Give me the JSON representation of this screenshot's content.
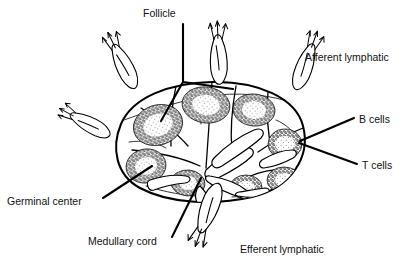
{
  "figure": {
    "background_color": "#ffffff",
    "ink_color": "#000000",
    "width": 409,
    "height": 261
  },
  "labels": [
    {
      "id": "follicle",
      "text": "Follicle",
      "x": 143,
      "y": 14,
      "anchor": "start",
      "leader": "M 183 24 L 183 82 M 183 82 L 160 120 M 183 82 L 233 89"
    },
    {
      "id": "afferent-lymphatic",
      "text": "Afferent lymphatic",
      "x": 305,
      "y": 58,
      "anchor": "start",
      "leader": ""
    },
    {
      "id": "b-cells",
      "text": "B cells",
      "x": 359,
      "y": 120,
      "anchor": "start",
      "leader": "M 354 118 L 300 141"
    },
    {
      "id": "t-cells",
      "text": "T cells",
      "x": 362,
      "y": 166,
      "anchor": "start",
      "leader": "M 357 164 L 299 143"
    },
    {
      "id": "germinal-center",
      "text": "Germinal center",
      "x": 7,
      "y": 202,
      "anchor": "start",
      "leader": "M 103 198 L 152 166"
    },
    {
      "id": "medullary-cord",
      "text": "Medullary cord",
      "x": 88,
      "y": 242,
      "anchor": "start",
      "leader": "M 172 237 L 201 178"
    },
    {
      "id": "efferent-lymphatic",
      "text": "Efferent lymphatic",
      "x": 240,
      "y": 250,
      "anchor": "start",
      "leader": ""
    }
  ],
  "node": {
    "capsule_path": "M 212 82 C 258 81 296 98 303 126 C 311 157 291 188 252 197 C 212 206 168 203 140 188 C 116 175 111 148 121 124 C 132 98 168 83 212 82 Z",
    "follicles": [
      {
        "id": "follicle-upper-left",
        "cx": 158,
        "cy": 125,
        "rx": 25,
        "ry": 20,
        "rot": -18,
        "gc_rx": 15,
        "gc_ry": 11
      },
      {
        "id": "follicle-upper-mid",
        "cx": 206,
        "cy": 105,
        "rx": 24,
        "ry": 18,
        "rot": 8,
        "gc_rx": 14,
        "gc_ry": 10
      },
      {
        "id": "follicle-upper-right",
        "cx": 254,
        "cy": 110,
        "rx": 21,
        "ry": 16,
        "rot": 6,
        "gc_rx": 12,
        "gc_ry": 9
      },
      {
        "id": "follicle-left-lower",
        "cx": 146,
        "cy": 166,
        "rx": 20,
        "ry": 17,
        "rot": -10,
        "gc_rx": 11,
        "gc_ry": 9
      },
      {
        "id": "follicle-mid-lower",
        "cx": 188,
        "cy": 183,
        "rx": 17,
        "ry": 13,
        "rot": 5,
        "gc_rx": 9,
        "gc_ry": 7
      },
      {
        "id": "follicle-right-mid",
        "cx": 285,
        "cy": 144,
        "rx": 17,
        "ry": 15,
        "rot": 0,
        "gc_rx": 10,
        "gc_ry": 8
      },
      {
        "id": "follicle-right-lower",
        "cx": 284,
        "cy": 180,
        "rx": 17,
        "ry": 13,
        "rot": 0,
        "gc_rx": 9,
        "gc_ry": 7
      },
      {
        "id": "follicle-bottom-mid",
        "cx": 246,
        "cy": 187,
        "rx": 16,
        "ry": 12,
        "rot": 0,
        "gc_rx": 9,
        "gc_ry": 6
      }
    ],
    "afferent_vessels": [
      {
        "id": "afferent-upper-left",
        "transform": "translate(128,76) rotate(-26) scale(1.0)"
      },
      {
        "id": "afferent-mid-left",
        "transform": "translate(96,127) rotate(-64) scale(0.92)"
      },
      {
        "id": "afferent-top",
        "transform": "translate(218,70) rotate(-2) scale(1.02)"
      },
      {
        "id": "afferent-upper-right",
        "transform": "translate(300,76) rotate(20) scale(1.0)"
      }
    ],
    "efferent_vessel": {
      "id": "efferent-bottom",
      "transform": "translate(212,196) rotate(160) scale(1.08)"
    },
    "septa": [
      "M 176 86 C 172 104 170 124 171 146",
      "M 141 108 C 160 120 176 132 188 146",
      "M 132 150 C 155 152 180 157 200 166",
      "M 236 86 C 232 108 230 130 232 150",
      "M 268 92 C 266 112 268 134 272 152",
      "M 303 128 C 288 134 272 142 258 152",
      "M 298 170 C 282 168 264 170 248 177",
      "M 212 82 C 210 110 208 140 206 168"
    ],
    "sinuses": [
      "M 124 120 C 146 112 176 102 206 96",
      "M 206 96 C 238 92 270 94 296 104",
      "M 129 142 C 142 140 156 142 166 148",
      "M 276 120 C 286 124 294 132 299 140",
      "M 146 186 C 164 192 186 196 208 197",
      "M 232 197 C 256 196 278 190 294 180",
      "M 190 90 C 196 100 200 112 201 124"
    ],
    "medullary_cords": [
      "M 206 170 C 216 160 228 152 242 148 C 250 146 256 150 252 156 C 244 164 230 172 218 178 C 210 182 202 178 206 170 Z",
      "M 210 176 C 222 178 236 182 246 190 C 252 195 248 200 242 198 C 230 194 216 188 208 182 C 204 179 205 175 210 176 Z",
      "M 214 158 C 226 146 240 136 254 130 C 262 127 266 132 261 138 C 250 148 234 158 222 166 C 214 171 209 164 214 158 Z",
      "M 262 160 C 272 154 282 150 292 150 C 297 150 298 155 293 158 C 284 163 272 167 264 168 C 259 168 258 163 262 160 Z",
      "M 238 196 C 248 198 258 198 266 195 C 271 193 270 188 265 188 C 256 189 246 191 239 192 C 235 193 234 195 238 196 Z"
    ],
    "hilum_path": "M 200 186 C 206 192 210 198 212 206 C 214 214 216 222 214 230 C 213 236 208 236 207 230 C 205 220 202 210 197 202 C 194 197 196 188 200 186 Z"
  }
}
